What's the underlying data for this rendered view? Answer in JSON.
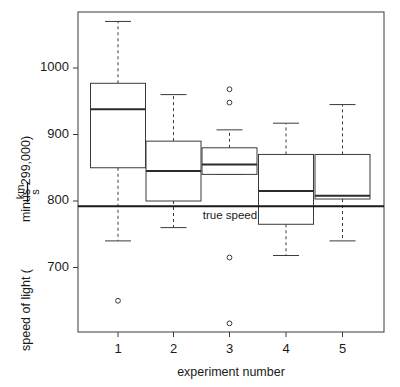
{
  "chart_data": {
    "type": "boxplot",
    "title": "",
    "xlabel": "experiment number",
    "ylabel_parts": {
      "prefix": "speed of light (",
      "numerator": "km",
      "denominator": "s",
      "suffix": " minus 299,000)"
    },
    "ylabel": "speed of light ( km / s minus 299,000)",
    "categories": [
      "1",
      "2",
      "3",
      "4",
      "5"
    ],
    "xtick_labels": [
      "1",
      "2",
      "3",
      "4",
      "5"
    ],
    "ytick_labels": [
      "700",
      "800",
      "900",
      "1000"
    ],
    "yticks": [
      700,
      800,
      900,
      1000
    ],
    "ylim": [
      600,
      1080
    ],
    "xlim": [
      0.5,
      5.5
    ],
    "grid": false,
    "legend": false,
    "reference_line": {
      "label": "true speed",
      "value": 792,
      "color": "#1a1a1a"
    },
    "boxes": [
      {
        "category": "1",
        "whisker_low": 740,
        "q1": 850,
        "median": 938,
        "q3": 977,
        "whisker_high": 1070,
        "outliers": [
          650
        ]
      },
      {
        "category": "2",
        "whisker_low": 760,
        "q1": 800,
        "median": 845,
        "q3": 890,
        "whisker_high": 960,
        "outliers": []
      },
      {
        "category": "3",
        "whisker_low": 840,
        "q1": 840,
        "median": 855,
        "q3": 880,
        "whisker_high": 907,
        "outliers": [
          968,
          948,
          715,
          616
        ]
      },
      {
        "category": "4",
        "whisker_low": 718,
        "q1": 765,
        "median": 815,
        "q3": 870,
        "whisker_high": 917,
        "outliers": []
      },
      {
        "category": "5",
        "whisker_low": 740,
        "q1": 803,
        "median": 808,
        "q3": 870,
        "whisker_high": 945,
        "outliers": []
      }
    ],
    "style": {
      "line_color": "#3a3a3a",
      "median_color": "#2b2b2b",
      "box_fill": "#ffffff",
      "whisker_dash": "3 3",
      "background": "#ffffff"
    }
  }
}
